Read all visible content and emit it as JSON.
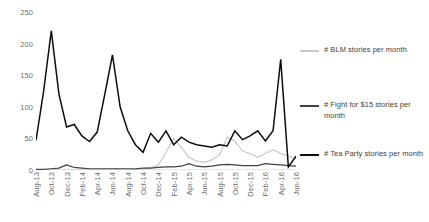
{
  "chart_data": {
    "type": "line",
    "title": "",
    "xlabel": "",
    "ylabel": "",
    "ylim": [
      0,
      250
    ],
    "yticks": [
      0,
      50,
      100,
      150,
      200,
      250
    ],
    "grid": false,
    "legend_position": "right",
    "x": [
      "Aug-13",
      "Sep-13",
      "Oct-13",
      "Nov-13",
      "Dec-13",
      "Jan-14",
      "Feb-14",
      "Mar-14",
      "Apr-14",
      "May-14",
      "Jun-14",
      "Jul-14",
      "Aug-14",
      "Sep-14",
      "Oct-14",
      "Nov-14",
      "Dec-14",
      "Jan-15",
      "Feb-15",
      "Mar-15",
      "Apr-15",
      "May-15",
      "Jun-15",
      "Jul-15",
      "Aug-15",
      "Sep-15",
      "Oct-15",
      "Nov-15",
      "Dec-15",
      "Jan-16",
      "Feb-16",
      "Mar-16",
      "Apr-16",
      "May-16",
      "Jun-16"
    ],
    "xtick_labels": [
      "Aug-13",
      "Oct-13",
      "Dec-13",
      "Feb-14",
      "Apr-14",
      "Jun-14",
      "Aug-14",
      "Oct-14",
      "Dec-14",
      "Feb-15",
      "Apr-15",
      "Jun-15",
      "Aug-15",
      "Oct-15",
      "Dec-15",
      "Feb-16",
      "Apr-16",
      "Jun-16"
    ],
    "xtick_indices": [
      0,
      2,
      4,
      6,
      8,
      10,
      12,
      14,
      16,
      18,
      20,
      22,
      24,
      26,
      28,
      30,
      32,
      34
    ],
    "series": [
      {
        "name": "# BLM stories per month",
        "color": "#c9c9c9",
        "values": [
          0,
          0,
          0,
          0,
          0,
          0,
          0,
          0,
          0,
          0,
          0,
          0,
          0,
          1,
          2,
          4,
          8,
          28,
          50,
          36,
          20,
          14,
          12,
          16,
          24,
          52,
          46,
          30,
          26,
          20,
          26,
          32,
          26,
          22,
          18
        ]
      },
      {
        "name": "# Fight for $15 stories per month",
        "color": "#404040",
        "values": [
          1,
          1,
          2,
          3,
          8,
          4,
          3,
          2,
          2,
          2,
          2,
          2,
          2,
          2,
          3,
          3,
          4,
          5,
          5,
          6,
          10,
          6,
          5,
          6,
          8,
          9,
          8,
          7,
          7,
          7,
          10,
          9,
          8,
          7,
          6
        ]
      },
      {
        "name": "# Tea Party stories per month",
        "color": "#0d0d0d",
        "values": [
          47,
          125,
          220,
          120,
          68,
          72,
          54,
          45,
          60,
          120,
          182,
          100,
          62,
          40,
          28,
          58,
          44,
          62,
          40,
          52,
          44,
          40,
          38,
          36,
          40,
          38,
          62,
          48,
          54,
          62,
          46,
          62,
          175,
          5,
          22
        ]
      }
    ]
  },
  "legend": {
    "entries": [
      {
        "label": "# BLM stories per month",
        "color": "#c9c9c9"
      },
      {
        "label": "# Fight for $15 stories per month",
        "color": "#404040"
      },
      {
        "label": "# Tea Party stories per month",
        "color": "#0d0d0d"
      }
    ]
  }
}
